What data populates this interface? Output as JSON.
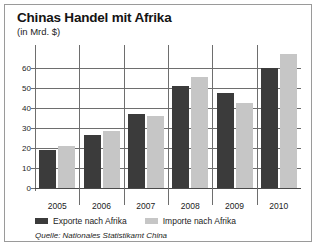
{
  "chart_data": {
    "type": "bar",
    "title": "Chinas Handel mit Afrika",
    "subtitle": "(in Mrd. $)",
    "xlabel": "",
    "ylabel": "",
    "unit_note": "(in Mrd. $)",
    "categories": [
      "2005",
      "2006",
      "2007",
      "2008",
      "2009",
      "2010"
    ],
    "series": [
      {
        "name": "Exporte nach Afrika",
        "color": "#3b3b3b",
        "values": [
          19,
          26.5,
          37,
          51,
          47.5,
          60
        ]
      },
      {
        "name": "Importe nach Afrika",
        "color": "#c6c6c6",
        "values": [
          21,
          28.7,
          36,
          55.5,
          42.5,
          67
        ]
      }
    ],
    "ylim": [
      0,
      70
    ],
    "yticks": [
      "0",
      "10",
      "20",
      "30",
      "40",
      "50",
      "60"
    ],
    "ytick_values": [
      0,
      10,
      20,
      30,
      40,
      50,
      60
    ],
    "grid": true,
    "legend_position": "bottom-left",
    "source": "Quelle: Nationales Statistikamt China"
  },
  "colors": {
    "export_bar": "#3b3b3b",
    "import_bar": "#c6c6c6",
    "grid": "#6e6e6e",
    "frame": "#9a9a9a",
    "background": "#ffffff",
    "text": "#1c1c1c"
  }
}
